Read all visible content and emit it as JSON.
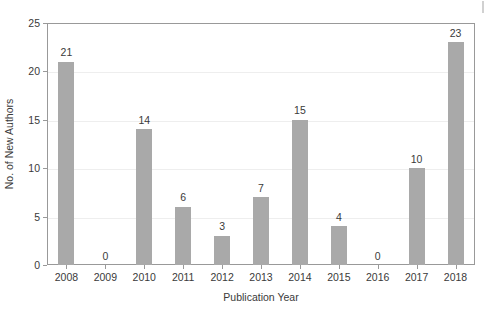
{
  "chart_data": {
    "type": "bar",
    "title": "",
    "xlabel": "Publication Year",
    "ylabel": "No. of New Authors",
    "categories": [
      "2008",
      "2009",
      "2010",
      "2011",
      "2012",
      "2013",
      "2014",
      "2015",
      "2016",
      "2017",
      "2018"
    ],
    "values": [
      21,
      0,
      14,
      6,
      3,
      7,
      15,
      4,
      0,
      10,
      23
    ],
    "value_labels": [
      "21",
      "0",
      "14",
      "6",
      "3",
      "7",
      "15",
      "4",
      "0",
      "10",
      "23"
    ],
    "ylim": [
      0,
      25
    ],
    "ytick_values": [
      0,
      5,
      10,
      15,
      20,
      25
    ],
    "ytick_labels": [
      "0",
      "5",
      "10",
      "15",
      "20",
      "25"
    ],
    "grid": true,
    "grid_axis": "y",
    "legend": null,
    "legend_position": "none",
    "bar_color": "#a9a9a9",
    "frame_color": "#999999",
    "grid_color": "#eeeeee",
    "text_color": "#3a3a3a",
    "background_color": "#ffffff",
    "data_labels_shown": true
  }
}
